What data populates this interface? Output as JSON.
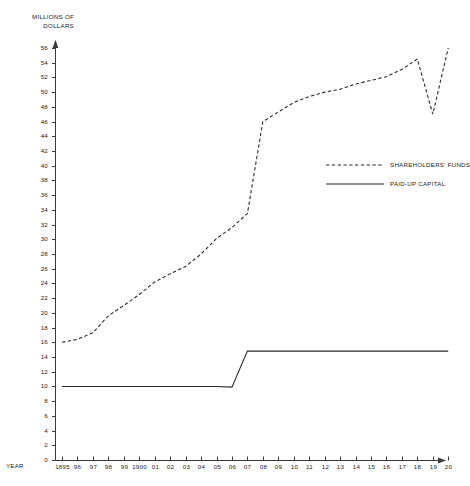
{
  "chart_data": {
    "type": "line",
    "title": "",
    "ylabel": "MILLIONS OF DOLLARS",
    "xlabel": "YEAR",
    "ylim": [
      0,
      56
    ],
    "ytick_step": 2,
    "yticks": [
      0,
      2,
      4,
      6,
      8,
      10,
      12,
      14,
      16,
      18,
      20,
      22,
      24,
      26,
      28,
      30,
      32,
      34,
      36,
      38,
      40,
      42,
      44,
      46,
      48,
      50,
      52,
      54,
      56
    ],
    "grid": false,
    "legend_position": "right-middle",
    "categories": [
      "1895",
      "96",
      "97",
      "98",
      "99",
      "1900",
      "01",
      "02",
      "03",
      "04",
      "05",
      "06",
      "07",
      "08",
      "09",
      "10",
      "11",
      "12",
      "13",
      "14",
      "15",
      "16",
      "17",
      "18",
      "19",
      "20"
    ],
    "series": [
      {
        "name": "SHAREHOLDERS' FUNDS",
        "style": "dashed",
        "color": "#2b2b2b",
        "values": [
          16.0,
          16.4,
          17.3,
          19.6,
          21.0,
          22.5,
          24.2,
          25.3,
          26.3,
          28.0,
          30.1,
          31.6,
          33.5,
          46.0,
          47.3,
          48.6,
          49.4,
          50.0,
          50.4,
          51.1,
          51.6,
          52.1,
          53.1,
          54.5,
          47.0,
          56.0
        ]
      },
      {
        "name": "PAID-UP CAPITAL",
        "style": "solid",
        "color": "#2b2b2b",
        "values": [
          10.0,
          10.0,
          10.0,
          10.0,
          10.0,
          10.0,
          10.0,
          10.0,
          10.0,
          10.0,
          10.0,
          9.9,
          14.8,
          14.8,
          14.8,
          14.8,
          14.8,
          14.8,
          14.8,
          14.8,
          14.8,
          14.8,
          14.8,
          14.8,
          14.8,
          14.8
        ]
      }
    ]
  },
  "legend": {
    "entries": [
      {
        "label": "SHAREHOLDERS' FUNDS",
        "style": "dashed"
      },
      {
        "label": "PAID-UP CAPITAL",
        "style": "solid"
      }
    ]
  },
  "axes": {
    "y_title_line1": "MILLIONS OF",
    "y_title_line2": "DOLLARS",
    "x_title": "YEAR"
  }
}
